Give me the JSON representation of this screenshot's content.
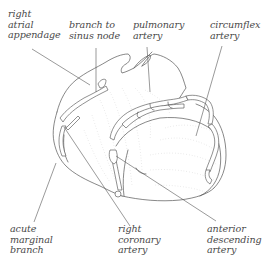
{
  "figure": {
    "line_color": "#555555",
    "text_color": "#4a4a4a",
    "labels": {
      "right_atrial_appendage": "right\natrial\nappendage",
      "branch_to_sinus_node": "branch to\nsinus node",
      "pulmonary_artery": "pulmonary\nartery",
      "circumflex_artery": "circumflex\nartery",
      "acute_marginal_branch": "acute\nmarginal\nbranch",
      "right_coronary_artery": "right\ncoronary\nartery",
      "anterior_descending_artery": "anterior\ndescending\nartery"
    }
  }
}
